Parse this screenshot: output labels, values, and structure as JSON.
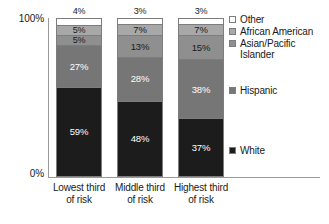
{
  "chart_data": {
    "type": "bar",
    "subtype": "100% stacked column",
    "title": "",
    "xlabel": "",
    "ylabel": "",
    "ylim": [
      0,
      100
    ],
    "ytick_labels": [
      "0%",
      "100%"
    ],
    "grid": false,
    "legend_position": "right",
    "categories": [
      "Lowest third\nof risk",
      "Middle third\nof risk",
      "Highest third\nof risk"
    ],
    "series": [
      {
        "name": "White",
        "color": "#1c1c1c",
        "label_color": "light",
        "values": [
          59,
          48,
          37
        ],
        "labels": [
          "59%",
          "48%",
          "37%"
        ]
      },
      {
        "name": "Hispanic",
        "color": "#767676",
        "label_color": "light",
        "values": [
          27,
          28,
          38
        ],
        "labels": [
          "27%",
          "28%",
          "38%"
        ]
      },
      {
        "name": "Asian/Pacific\nIslander",
        "color": "#8f8f8f",
        "label_color": "dark",
        "values": [
          5,
          13,
          15
        ],
        "labels": [
          "5%",
          "13%",
          "15%"
        ]
      },
      {
        "name": "African American",
        "color": "#a8a8a8",
        "label_color": "dark",
        "values": [
          5,
          7,
          7
        ],
        "labels": [
          "5%",
          "7%",
          "7%"
        ]
      },
      {
        "name": "Other",
        "color": "#ffffff",
        "label_color": "dark",
        "values": [
          4,
          3,
          3
        ],
        "labels": [
          "4%",
          "3%",
          "3%"
        ]
      }
    ],
    "legend_entries": [
      {
        "label": "Other",
        "color": "#ffffff"
      },
      {
        "label": "African American",
        "color": "#a8a8a8"
      },
      {
        "label": "Asian/Pacific\nIslander",
        "color": "#8f8f8f"
      },
      {
        "label": "Hispanic",
        "color": "#767676"
      },
      {
        "label": "White",
        "color": "#1c1c1c"
      }
    ]
  },
  "axis": {
    "y_top": "100%",
    "y_bottom": "0%"
  }
}
